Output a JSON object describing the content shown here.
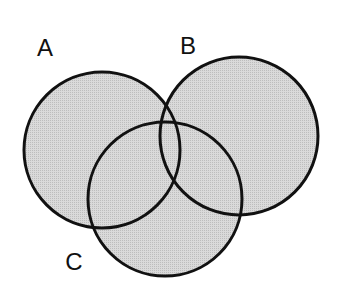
{
  "diagram": {
    "type": "venn",
    "fill_color": "#d6d6d6",
    "stroke_color": "#111111",
    "sets": [
      {
        "id": "A",
        "label": "A",
        "cx": 102,
        "cy": 150,
        "r": 78,
        "label_x": 45,
        "label_y": 56
      },
      {
        "id": "B",
        "label": "B",
        "cx": 239,
        "cy": 136,
        "r": 79,
        "label_x": 188,
        "label_y": 54
      },
      {
        "id": "C",
        "label": "C",
        "cx": 165,
        "cy": 199,
        "r": 77,
        "label_x": 74,
        "label_y": 270
      }
    ]
  }
}
